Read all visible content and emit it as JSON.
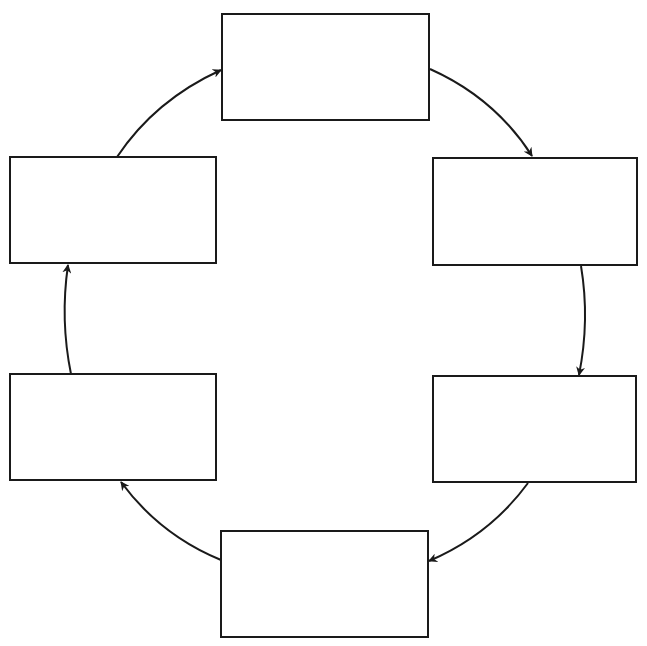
{
  "diagram": {
    "type": "cycle",
    "direction": "clockwise",
    "stroke_color": "#1a1a1a",
    "background": "#ffffff",
    "nodes": [
      {
        "id": "top",
        "label": ""
      },
      {
        "id": "right-top",
        "label": ""
      },
      {
        "id": "right-bottom",
        "label": ""
      },
      {
        "id": "bottom",
        "label": ""
      },
      {
        "id": "left-bottom",
        "label": ""
      },
      {
        "id": "left-top",
        "label": ""
      }
    ],
    "edges": [
      {
        "from": "top",
        "to": "right-top"
      },
      {
        "from": "right-top",
        "to": "right-bottom"
      },
      {
        "from": "right-bottom",
        "to": "bottom"
      },
      {
        "from": "bottom",
        "to": "left-bottom"
      },
      {
        "from": "left-bottom",
        "to": "left-top"
      },
      {
        "from": "left-top",
        "to": "top"
      }
    ]
  }
}
